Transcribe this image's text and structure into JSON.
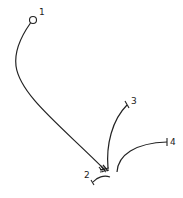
{
  "diagram": {
    "type": "hand-drawn line sketch",
    "labels": {
      "n1": "1",
      "n2": "2",
      "n3": "3",
      "n4": "4"
    },
    "stroke_color": "#222222",
    "background": "#ffffff"
  }
}
